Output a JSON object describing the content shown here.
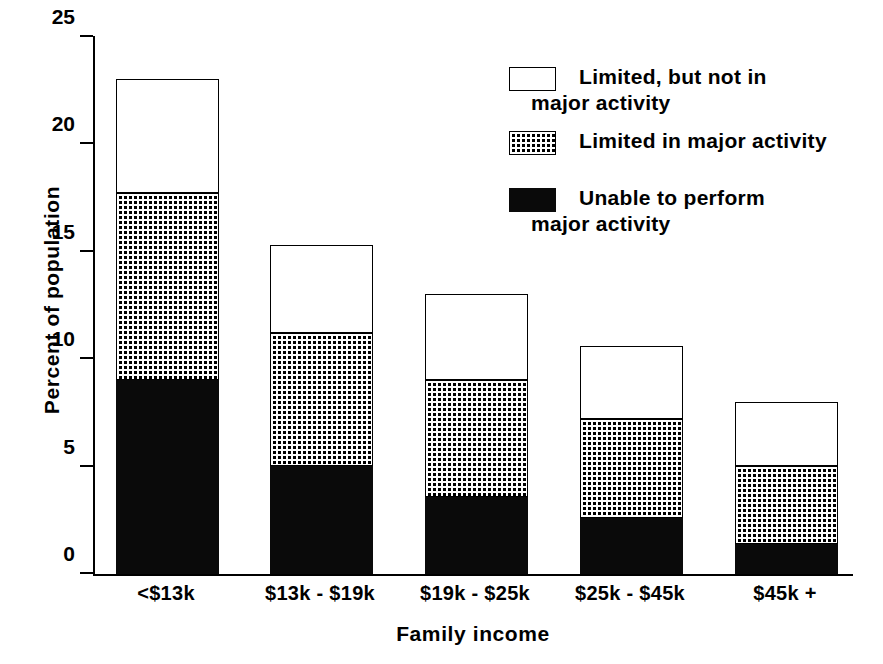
{
  "chart_data": {
    "type": "bar",
    "stacked": true,
    "title": "",
    "xlabel": "Family income",
    "ylabel": "Percent of population",
    "categories": [
      "<$13k",
      "$13k - $19k",
      "$19k - $25k",
      "$25k - $45k",
      "$45k +"
    ],
    "ylim": [
      0,
      25
    ],
    "yticks": [
      "0",
      "5",
      "10",
      "15",
      "20",
      "25"
    ],
    "ytick_values": [
      0,
      5,
      10,
      15,
      20,
      25
    ],
    "grid": false,
    "legend_position": "upper right",
    "series": [
      {
        "name": "Unable to perform major activity",
        "fill": "solid-black",
        "color": "#0a0a0a",
        "values": [
          9.0,
          5.0,
          3.6,
          2.6,
          1.4
        ]
      },
      {
        "name": "Limited in major activity",
        "fill": "dotted",
        "color": "#ffffff",
        "values": [
          8.7,
          6.2,
          5.4,
          4.6,
          3.6
        ]
      },
      {
        "name": "Limited, but not in major activity",
        "fill": "white",
        "color": "#ffffff",
        "values": [
          5.3,
          4.1,
          4.0,
          3.4,
          3.0
        ]
      }
    ],
    "totals": [
      23.0,
      15.3,
      13.0,
      10.6,
      8.0
    ]
  },
  "legend": {
    "items": [
      {
        "key": "white",
        "line1": "Limited, but not in",
        "line2": "major activity"
      },
      {
        "key": "dot",
        "line1": "Limited in major activity",
        "line2": ""
      },
      {
        "key": "black",
        "line1": "Unable to perform",
        "line2": "major activity"
      }
    ]
  }
}
